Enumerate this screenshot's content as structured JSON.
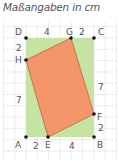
{
  "title": "Maßangaben in cm",
  "colors": {
    "rectangle_fill": "#c5e3a3",
    "quadrilateral_fill": "#f4956a",
    "quadrilateral_stroke": "#c0603a",
    "grid": "#e4e4e4",
    "label": "#555555"
  },
  "points": {
    "A": "A",
    "B": "B",
    "C": "C",
    "D": "D",
    "E": "E",
    "F": "F",
    "G": "G",
    "H": "H"
  },
  "measures": {
    "DG": "4",
    "GC": "2",
    "DH": "2",
    "HA": "7",
    "AE": "2",
    "EB": "4",
    "BF": "2",
    "FC": "7"
  }
}
